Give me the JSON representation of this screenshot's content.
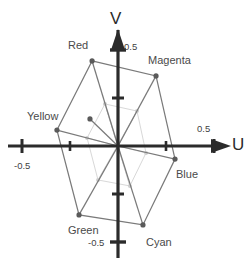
{
  "figure": {
    "background_color": "#ffffff",
    "axis_color": "#2b2b2b",
    "outer_line_color": "#7a7a7a",
    "inner_line_color": "#d8d8d8",
    "point_color": "#5a5a5a",
    "faint_point_color": "#cfcfcf"
  },
  "axes": {
    "u": {
      "label": "U",
      "label_x": 232,
      "label_y": 146,
      "tick_labels": [
        {
          "text": "-0.5",
          "x": 14,
          "y": 161
        },
        {
          "text": "0.5",
          "x": 197,
          "y": 124
        }
      ]
    },
    "v": {
      "label": "V",
      "label_x": 110,
      "label_y": 10,
      "tick_labels": [
        {
          "text": "0.5",
          "x": 124,
          "y": 42
        },
        {
          "text": "-0.5",
          "x": 88,
          "y": 238
        }
      ]
    }
  },
  "chart_data": {
    "type": "scatter",
    "xlabel": "U",
    "ylabel": "V",
    "xlim": [
      -0.75,
      0.75
    ],
    "ylim": [
      -0.75,
      0.75
    ],
    "grid": false,
    "legend": "none",
    "origin_px": {
      "x": 118,
      "y": 146
    },
    "scale_px_per_unit": 192,
    "xticks": [
      -0.5,
      0.5
    ],
    "yticks": [
      -0.5,
      0.5
    ],
    "series": [
      {
        "name": "outer",
        "closed": true,
        "points": [
          {
            "label": "Red",
            "u": -0.135,
            "v": 0.443
          },
          {
            "label": "Magenta",
            "u": 0.198,
            "v": 0.365
          },
          {
            "label": "Blue",
            "u": 0.297,
            "v": -0.068
          },
          {
            "label": "Cyan",
            "u": 0.13,
            "v": -0.411
          },
          {
            "label": "Green",
            "u": -0.203,
            "v": -0.359
          },
          {
            "label": "Yellow",
            "u": -0.318,
            "v": 0.083
          }
        ]
      },
      {
        "name": "inner",
        "closed": true,
        "points": [
          {
            "label": "Red",
            "u": -0.068,
            "v": 0.219
          },
          {
            "label": "Magenta",
            "u": 0.099,
            "v": 0.182
          },
          {
            "label": "Blue",
            "u": 0.146,
            "v": -0.036
          },
          {
            "label": "Cyan",
            "u": 0.062,
            "v": -0.208
          },
          {
            "label": "Green",
            "u": -0.104,
            "v": -0.177
          },
          {
            "label": "Yellow",
            "u": -0.161,
            "v": 0.042
          }
        ]
      }
    ],
    "extra_points": [
      {
        "name": "mid-vertex",
        "u": -0.146,
        "v": 0.141
      }
    ],
    "annotations": [
      {
        "text": "Red",
        "x": 68,
        "y": 40,
        "point_u": -0.135,
        "point_v": 0.443
      },
      {
        "text": "Magenta",
        "x": 148,
        "y": 55,
        "point_u": 0.198,
        "point_v": 0.365
      },
      {
        "text": "Yellow",
        "x": 27,
        "y": 111,
        "point_u": -0.318,
        "point_v": 0.083
      },
      {
        "text": "Blue",
        "x": 176,
        "y": 169,
        "point_u": 0.297,
        "point_v": -0.068
      },
      {
        "text": "Green",
        "x": 68,
        "y": 225,
        "point_u": -0.203,
        "point_v": -0.359
      },
      {
        "text": "Cyan",
        "x": 146,
        "y": 237,
        "point_u": 0.13,
        "point_v": -0.411
      }
    ]
  }
}
